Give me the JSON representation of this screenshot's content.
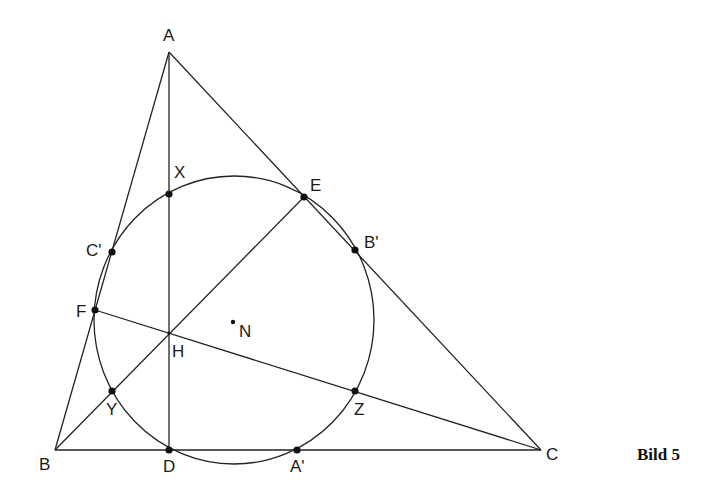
{
  "figure": {
    "caption": "Bild 5",
    "colors": {
      "stroke": "#222222",
      "background": "#ffffff"
    }
  },
  "points": {
    "A": {
      "label": "A",
      "x": 169,
      "y": 52
    },
    "B": {
      "label": "B",
      "x": 55,
      "y": 450
    },
    "C": {
      "label": "C",
      "x": 541,
      "y": 450
    },
    "D": {
      "label": "D",
      "x": 169,
      "y": 450
    },
    "E": {
      "label": "E",
      "x": 304,
      "y": 197
    },
    "F": {
      "label": "F",
      "x": 95,
      "y": 310
    },
    "H": {
      "label": "H",
      "x": 169,
      "y": 333
    },
    "N": {
      "label": "N",
      "x": 233,
      "y": 322
    },
    "X": {
      "label": "X",
      "x": 169,
      "y": 194
    },
    "Y": {
      "label": "Y",
      "x": 112,
      "y": 391
    },
    "Z": {
      "label": "Z",
      "x": 355,
      "y": 391
    },
    "A1": {
      "label": "A'",
      "x": 297,
      "y": 450
    },
    "B1": {
      "label": "B'",
      "x": 355,
      "y": 250
    },
    "C1": {
      "label": "C'",
      "x": 112,
      "y": 252
    }
  },
  "circle": {
    "label": "nine-point circle",
    "cx": 234,
    "cy": 320,
    "rx": 140,
    "ry": 144
  },
  "segments": [
    [
      "A",
      "B"
    ],
    [
      "B",
      "C"
    ],
    [
      "C",
      "A"
    ],
    [
      "A",
      "D"
    ],
    [
      "B",
      "E"
    ],
    [
      "C",
      "F"
    ]
  ]
}
